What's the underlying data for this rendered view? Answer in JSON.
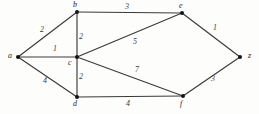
{
  "diagram": {
    "background_color": "#fdfdfc",
    "edge_color": "#3a3a3a",
    "vertex_color": "#141414",
    "width": 259,
    "height": 114
  },
  "vertices": [
    {
      "id": "a",
      "label": "a",
      "x": 18,
      "y": 57,
      "label_x": 8,
      "label_y": 52
    },
    {
      "id": "b",
      "label": "b",
      "x": 77,
      "y": 12,
      "label_x": 73,
      "label_y": 1
    },
    {
      "id": "c",
      "label": "c",
      "x": 77,
      "y": 57,
      "label_x": 68,
      "label_y": 59
    },
    {
      "id": "d",
      "label": "d",
      "x": 77,
      "y": 97,
      "label_x": 73,
      "label_y": 100
    },
    {
      "id": "e",
      "label": "e",
      "x": 182,
      "y": 13,
      "label_x": 179,
      "label_y": 2
    },
    {
      "id": "f",
      "label": "f",
      "x": 183,
      "y": 96,
      "label_x": 180,
      "label_y": 100
    },
    {
      "id": "z",
      "label": "z",
      "x": 240,
      "y": 57,
      "label_x": 248,
      "label_y": 52
    }
  ],
  "edges": [
    {
      "id": "a-b",
      "from": "a",
      "to": "b",
      "weight": "2",
      "label_x": 40,
      "label_y": 26
    },
    {
      "id": "a-c",
      "from": "a",
      "to": "c",
      "weight": "1",
      "label_x": 53,
      "label_y": 45
    },
    {
      "id": "a-d",
      "from": "a",
      "to": "d",
      "weight": "4",
      "label_x": 43,
      "label_y": 77
    },
    {
      "id": "b-c",
      "from": "b",
      "to": "c",
      "weight": "2",
      "label_x": 79,
      "label_y": 33
    },
    {
      "id": "b-e",
      "from": "b",
      "to": "e",
      "weight": "3",
      "label_x": 125,
      "label_y": 3
    },
    {
      "id": "c-e",
      "from": "c",
      "to": "e",
      "weight": "5",
      "label_x": 133,
      "label_y": 38
    },
    {
      "id": "c-d",
      "from": "c",
      "to": "d",
      "weight": "2",
      "label_x": 79,
      "label_y": 73
    },
    {
      "id": "c-f",
      "from": "c",
      "to": "f",
      "weight": "7",
      "label_x": 135,
      "label_y": 66
    },
    {
      "id": "d-f",
      "from": "d",
      "to": "f",
      "weight": "4",
      "label_x": 126,
      "label_y": 100
    },
    {
      "id": "e-z",
      "from": "e",
      "to": "z",
      "weight": "1",
      "label_x": 213,
      "label_y": 24
    },
    {
      "id": "f-z",
      "from": "f",
      "to": "z",
      "weight": "3",
      "label_x": 211,
      "label_y": 75
    }
  ]
}
